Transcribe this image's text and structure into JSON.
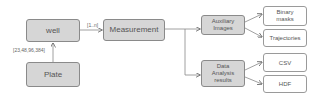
{
  "diagram": {
    "nodes": {
      "well": "well",
      "plate": "Plate",
      "measurement": "Measurement",
      "auxiliary_images": "Auxiliary Images",
      "data_analysis_results": "Data Analysis results",
      "binary_masks": "Binary masks",
      "trajectories": "Trajectories",
      "csv": "CSV",
      "hdf": "HDF"
    },
    "edge_labels": {
      "plate_to_well": "[23,48,96,384]",
      "well_to_measurement": "[1..n]"
    },
    "edges": [
      {
        "from": "plate",
        "to": "well",
        "label": "[23,48,96,384]"
      },
      {
        "from": "well",
        "to": "measurement",
        "label": "[1..n]"
      },
      {
        "from": "measurement",
        "to": "auxiliary_images"
      },
      {
        "from": "measurement",
        "to": "data_analysis_results"
      },
      {
        "from": "auxiliary_images",
        "to": "binary_masks"
      },
      {
        "from": "auxiliary_images",
        "to": "trajectories"
      },
      {
        "from": "data_analysis_results",
        "to": "csv"
      },
      {
        "from": "data_analysis_results",
        "to": "hdf"
      }
    ],
    "colors": {
      "grey_fill": "#d6d6d6",
      "white_fill": "#ffffff",
      "stroke": "#8a8a8a",
      "text": "#555555"
    }
  }
}
